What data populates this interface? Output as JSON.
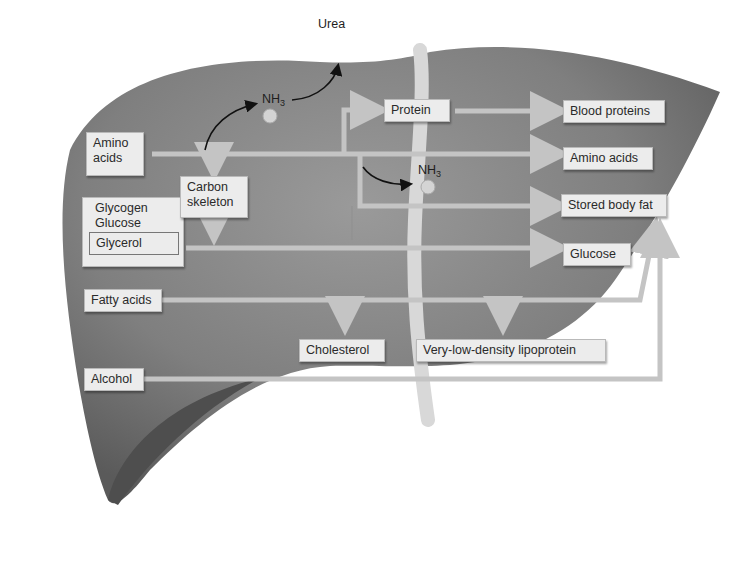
{
  "diagram": {
    "inputs": [
      {
        "id": "amino_acids",
        "label_line1": "Amino",
        "label_line2": "acids"
      },
      {
        "id": "carbohydrates",
        "label_line1": "Glycogen",
        "label_line2": "Glucose",
        "inner_label": "Glycerol"
      },
      {
        "id": "fatty_acids",
        "label": "Fatty acids"
      },
      {
        "id": "alcohol",
        "label": "Alcohol"
      }
    ],
    "intermediates": [
      {
        "id": "carbon_skeleton",
        "label_line1": "Carbon",
        "label_line2": "skeleton"
      },
      {
        "id": "protein",
        "label": "Protein"
      },
      {
        "id": "nh3_top",
        "label_main": "NH",
        "label_sub": "3"
      },
      {
        "id": "nh3_mid",
        "label_main": "NH",
        "label_sub": "3"
      },
      {
        "id": "urea",
        "label": "Urea"
      }
    ],
    "outputs": [
      {
        "id": "blood_proteins",
        "label": "Blood proteins"
      },
      {
        "id": "amino_acids_out",
        "label": "Amino acids"
      },
      {
        "id": "stored_body_fat",
        "label": "Stored body fat"
      },
      {
        "id": "glucose",
        "label": "Glucose"
      },
      {
        "id": "cholesterol",
        "label": "Cholesterol"
      },
      {
        "id": "vldl",
        "label": "Very-low-density lipoprotein"
      }
    ],
    "colors": {
      "liver": "#8a8a8a",
      "liver_dark": "#5e5e5e",
      "arrow": "#c4c4c4",
      "box_bg": "#ececec",
      "ligament": "#d8d8d8"
    }
  }
}
